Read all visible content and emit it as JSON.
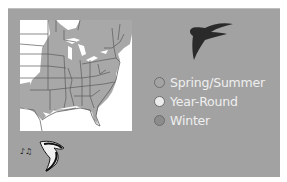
{
  "panel": {
    "background": "#a2a2a2"
  },
  "map": {
    "region": "Eastern United States",
    "range_color": "#a8a8a8",
    "background": "#ffffff",
    "border_color": "#5a5a5a"
  },
  "icons": {
    "bird_silhouette": "swift-silhouette-icon",
    "song": "bird-song-icon"
  },
  "legend": {
    "items": [
      {
        "label": "Spring/Summer",
        "color": "#a4a4a4"
      },
      {
        "label": "Year-Round",
        "color": "#ededed"
      },
      {
        "label": "Winter",
        "color": "#8c8c8c"
      }
    ]
  }
}
